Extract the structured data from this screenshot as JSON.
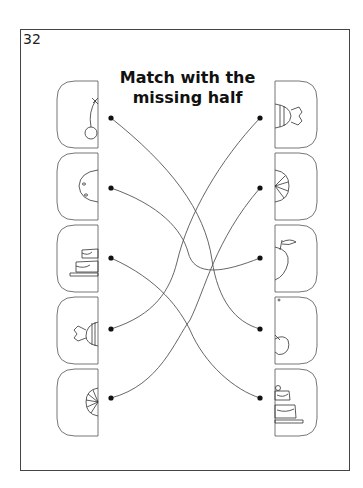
{
  "page": {
    "number": "32",
    "title_line1": "Match with the",
    "title_line2": "missing half"
  },
  "colors": {
    "frame": "#444444",
    "line": "#555555",
    "dot": "#111111"
  },
  "left_items": [
    {
      "icon": "cherry-half-icon",
      "y": 81
    },
    {
      "icon": "cookie-half-icon",
      "y": 153
    },
    {
      "icon": "cake-half-icon",
      "y": 225
    },
    {
      "icon": "candy-half-icon",
      "y": 297
    },
    {
      "icon": "lollipop-half-icon",
      "y": 369
    }
  ],
  "right_items": [
    {
      "icon": "candy-half-icon",
      "y": 81
    },
    {
      "icon": "lollipop-half-icon",
      "y": 153
    },
    {
      "icon": "apple-half-icon",
      "y": 225
    },
    {
      "icon": "cherry-half-icon",
      "y": 297
    },
    {
      "icon": "cake-half-icon",
      "y": 369
    }
  ],
  "connections": [
    {
      "from": "left-1",
      "to": "right-4"
    },
    {
      "from": "left-2",
      "to": "right-3"
    },
    {
      "from": "left-3",
      "to": "right-5"
    },
    {
      "from": "left-4",
      "to": "right-1"
    },
    {
      "from": "left-5",
      "to": "right-2"
    }
  ]
}
